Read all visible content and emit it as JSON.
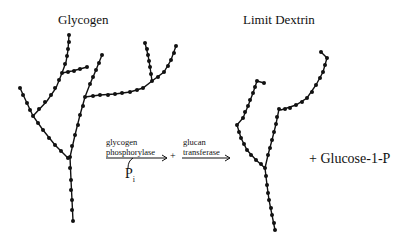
{
  "titles": {
    "left": "Glycogen",
    "right": "Limit Dextrin"
  },
  "reaction": {
    "enzyme1_line1": "glycogen",
    "enzyme1_line2": "phosphorylase",
    "plus_between": "+",
    "enzyme2_line1": "glucan",
    "enzyme2_line2": "transferase",
    "cosubstrate": "P",
    "cosubstrate_subscript": "i",
    "product": "+ Glucose-1-P"
  },
  "colors": {
    "ink": "#111111",
    "background": "#ffffff"
  }
}
